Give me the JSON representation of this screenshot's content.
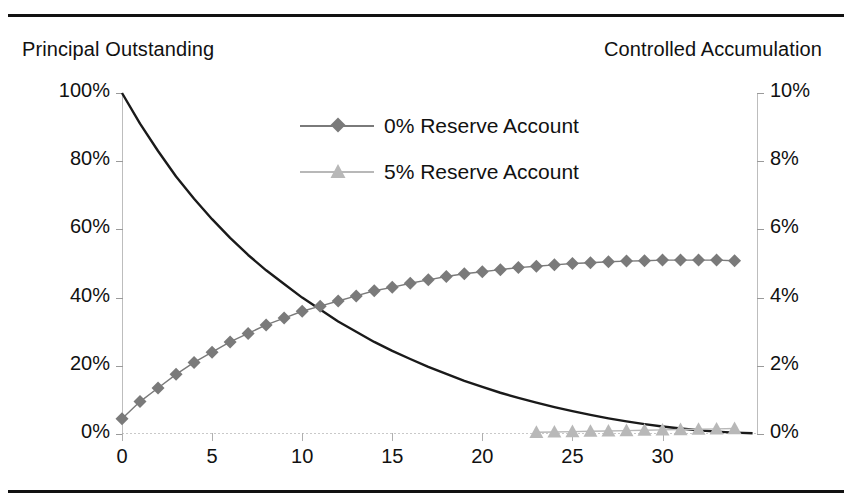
{
  "figure": {
    "left_axis_caption": "Principal Outstanding",
    "right_axis_caption": "Controlled Accumulation"
  },
  "legend": {
    "items": [
      {
        "label": "0% Reserve Account",
        "marker": "diamond-marker-icon",
        "color": "#7a7a7a"
      },
      {
        "label": "5% Reserve Account",
        "marker": "triangle-marker-icon",
        "color": "#b8b8b8"
      }
    ]
  },
  "chart_data": {
    "type": "line",
    "title": "",
    "xlabel": "",
    "ylabel": "Principal Outstanding",
    "y2label": "Controlled Accumulation",
    "grid": false,
    "legend_position": "inside-top-center",
    "xlim": [
      0,
      35.3
    ],
    "ylim": [
      0,
      100
    ],
    "y2lim": [
      0,
      10
    ],
    "xticks": [
      0,
      5,
      10,
      15,
      20,
      25,
      30
    ],
    "xticklabels": [
      "0",
      "5",
      "10",
      "15",
      "20",
      "25",
      "30"
    ],
    "yticks": [
      0,
      20,
      40,
      60,
      80,
      100
    ],
    "yticklabels": [
      "0%",
      "20%",
      "40%",
      "60%",
      "80%",
      "100%"
    ],
    "y2ticks": [
      0,
      2,
      4,
      6,
      8,
      10
    ],
    "y2ticklabels": [
      "0%",
      "2%",
      "4%",
      "6%",
      "8%",
      "10%"
    ],
    "series": [
      {
        "name": "Principal Outstanding",
        "axis": "left",
        "style": "solid-black-line",
        "color": "#1a1a1a",
        "marker": "none",
        "x": [
          0,
          1,
          2,
          3,
          4,
          5,
          6,
          7,
          8,
          9,
          10,
          11,
          12,
          13,
          14,
          15,
          16,
          17,
          18,
          19,
          20,
          21,
          22,
          23,
          24,
          25,
          26,
          27,
          28,
          29,
          30,
          31,
          32,
          33,
          34,
          35
        ],
        "values": [
          100,
          91,
          83,
          75.5,
          69,
          63,
          57.5,
          52.5,
          48,
          44,
          40,
          36.5,
          33,
          30,
          27,
          24.4,
          22,
          19.7,
          17.6,
          15.6,
          13.8,
          12.1,
          10.6,
          9.2,
          7.9,
          6.7,
          5.6,
          4.6,
          3.7,
          2.9,
          2.2,
          1.6,
          1.1,
          0.7,
          0.4,
          0.2
        ]
      },
      {
        "name": "0% Reserve Account",
        "axis": "right",
        "style": "line-with-diamond-markers",
        "color": "#7a7a7a",
        "marker": "diamond",
        "x": [
          0,
          1,
          2,
          3,
          4,
          5,
          6,
          7,
          8,
          9,
          10,
          11,
          12,
          13,
          14,
          15,
          16,
          17,
          18,
          19,
          20,
          21,
          22,
          23,
          24,
          25,
          26,
          27,
          28,
          29,
          30,
          31,
          32,
          33,
          34
        ],
        "values": [
          0.45,
          0.95,
          1.35,
          1.75,
          2.1,
          2.4,
          2.7,
          2.95,
          3.2,
          3.4,
          3.6,
          3.75,
          3.9,
          4.05,
          4.2,
          4.3,
          4.42,
          4.52,
          4.62,
          4.7,
          4.76,
          4.82,
          4.88,
          4.92,
          4.96,
          5.0,
          5.02,
          5.05,
          5.07,
          5.08,
          5.1,
          5.1,
          5.1,
          5.1,
          5.08
        ]
      },
      {
        "name": "5% Reserve Account",
        "axis": "right",
        "style": "line-with-triangle-markers",
        "color": "#b8b8b8",
        "marker": "triangle",
        "x": [
          23,
          24,
          25,
          26,
          27,
          28,
          29,
          30,
          31,
          32,
          33,
          34
        ],
        "values": [
          0.05,
          0.06,
          0.07,
          0.08,
          0.09,
          0.1,
          0.11,
          0.12,
          0.13,
          0.14,
          0.15,
          0.16
        ]
      }
    ]
  }
}
